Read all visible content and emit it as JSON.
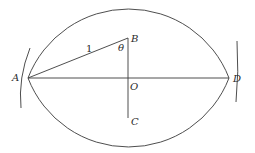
{
  "diagram": {
    "points": {
      "A": {
        "label": "A",
        "x": 28,
        "y": 78
      },
      "B": {
        "label": "B",
        "x": 128,
        "y": 38
      },
      "C": {
        "label": "C",
        "x": 128,
        "y": 118
      },
      "D": {
        "label": "D",
        "x": 229,
        "y": 78
      },
      "O": {
        "label": "O",
        "x": 128,
        "y": 78
      }
    },
    "segments": [
      {
        "from": "A",
        "to": "D"
      },
      {
        "from": "A",
        "to": "B"
      },
      {
        "from": "B",
        "to": "C"
      }
    ],
    "arcs": [
      {
        "name": "upper-arc",
        "center": "C",
        "through": [
          "A",
          "D"
        ]
      },
      {
        "name": "lower-arc",
        "center": "B",
        "through": [
          "A",
          "D"
        ]
      },
      {
        "name": "small-arc-at-A"
      },
      {
        "name": "small-arc-at-D"
      }
    ],
    "annotations": {
      "length_AB": "1",
      "angle_at_B": "θ"
    },
    "stroke_color": "#3a3a3a"
  }
}
